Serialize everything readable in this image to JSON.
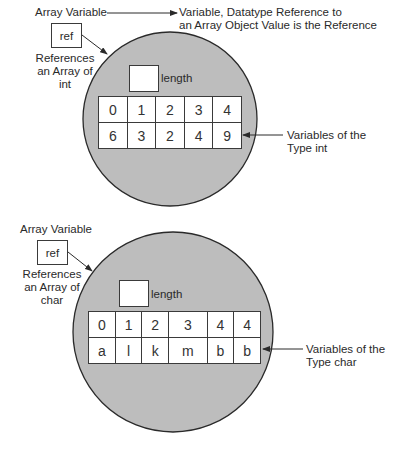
{
  "colors": {
    "circle_fill": "#bdbdbd",
    "line": "#2a2a2a",
    "box_fill": "#ffffff"
  },
  "top_header": {
    "array_variable": "Array Variable",
    "description_line1": "Variable, Datatype Reference to",
    "description_line2": "an Array Object Value is the Reference"
  },
  "diagram1": {
    "ref_label": "ref",
    "ref_caption": [
      "References",
      "an Array of",
      "int"
    ],
    "length_label": "length",
    "indices": [
      "0",
      "1",
      "2",
      "3",
      "4"
    ],
    "values": [
      "6",
      "3",
      "2",
      "4",
      "9"
    ],
    "variables_caption": [
      "Variables of the",
      "Type int"
    ]
  },
  "diagram2": {
    "array_variable": "Array Variable",
    "ref_label": "ref",
    "ref_caption": [
      "References",
      "an Array of",
      "char"
    ],
    "length_label": "length",
    "indices": [
      "0",
      "1",
      "2",
      "3",
      "4",
      "4"
    ],
    "values": [
      "a",
      "l",
      "k",
      "m",
      "b",
      "b"
    ],
    "variables_caption": [
      "Variables of the",
      "Type char"
    ]
  }
}
